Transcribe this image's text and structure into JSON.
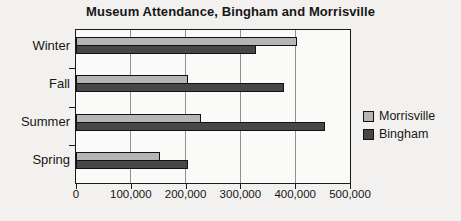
{
  "page": {
    "background": "#f2f1ef"
  },
  "chart_data": {
    "type": "bar",
    "orientation": "horizontal",
    "title": "Museum Attendance, Bingham and Morrisville",
    "categories": [
      "Winter",
      "Fall",
      "Summer",
      "Spring"
    ],
    "series": [
      {
        "name": "Morrisville",
        "color": "#b5b5b5",
        "values": [
          400000,
          200000,
          225000,
          150000
        ]
      },
      {
        "name": "Bingham",
        "color": "#474747",
        "values": [
          325000,
          375000,
          450000,
          200000
        ]
      }
    ],
    "xlabel": "",
    "ylabel": "",
    "xlim": [
      0,
      500000
    ],
    "x_ticks": [
      0,
      100000,
      200000,
      300000,
      400000,
      500000
    ],
    "x_tick_labels": [
      "0",
      "100,000",
      "200,000",
      "300,000",
      "400,000",
      "500,000"
    ],
    "grid": true,
    "legend_position": "right"
  }
}
